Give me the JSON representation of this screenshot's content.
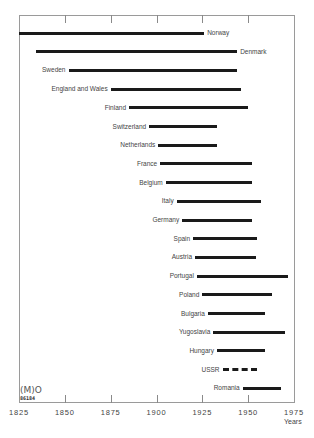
{
  "chart_data": {
    "type": "bar",
    "orientation": "horizontal-range",
    "title": "",
    "xlabel": "Years",
    "ylabel": "",
    "xlim": [
      1825,
      1975
    ],
    "x_ticks": [
      1825,
      1850,
      1875,
      1900,
      1925,
      1950,
      1975
    ],
    "grid": false,
    "legend": null,
    "series": [
      {
        "name": "Norway",
        "start": 1825,
        "end": 1926,
        "style": "solid",
        "label_side": "right"
      },
      {
        "name": "Denmark",
        "start": 1834,
        "end": 1944,
        "style": "solid",
        "label_side": "right"
      },
      {
        "name": "Sweden",
        "start": 1852,
        "end": 1944,
        "style": "solid",
        "label_side": "left"
      },
      {
        "name": "England and Wales",
        "start": 1875,
        "end": 1946,
        "style": "solid",
        "label_side": "left"
      },
      {
        "name": "Finland",
        "start": 1885,
        "end": 1950,
        "style": "solid",
        "label_side": "left"
      },
      {
        "name": "Switzerland",
        "start": 1896,
        "end": 1933,
        "style": "solid",
        "label_side": "left"
      },
      {
        "name": "Netherlands",
        "start": 1901,
        "end": 1933,
        "style": "solid",
        "label_side": "left"
      },
      {
        "name": "France",
        "start": 1902,
        "end": 1952,
        "style": "solid",
        "label_side": "left"
      },
      {
        "name": "Belgium",
        "start": 1905,
        "end": 1952,
        "style": "solid",
        "label_side": "left"
      },
      {
        "name": "Italy",
        "start": 1911,
        "end": 1957,
        "style": "solid",
        "label_side": "left"
      },
      {
        "name": "Germany",
        "start": 1914,
        "end": 1952,
        "style": "solid",
        "label_side": "left"
      },
      {
        "name": "Spain",
        "start": 1920,
        "end": 1955,
        "style": "solid",
        "label_side": "left"
      },
      {
        "name": "Austria",
        "start": 1921,
        "end": 1954,
        "style": "solid",
        "label_side": "left"
      },
      {
        "name": "Portugal",
        "start": 1922,
        "end": 1972,
        "style": "solid",
        "label_side": "left"
      },
      {
        "name": "Poland",
        "start": 1925,
        "end": 1963,
        "style": "solid",
        "label_side": "left"
      },
      {
        "name": "Bulgaria",
        "start": 1928,
        "end": 1959,
        "style": "solid",
        "label_side": "left"
      },
      {
        "name": "Yugoslavia",
        "start": 1931,
        "end": 1970,
        "style": "solid",
        "label_side": "left"
      },
      {
        "name": "Hungary",
        "start": 1933,
        "end": 1959,
        "style": "solid",
        "label_side": "left"
      },
      {
        "name": "USSR",
        "start": 1936,
        "end": 1955,
        "style": "dashed",
        "label_side": "left"
      },
      {
        "name": "Romania",
        "start": 1947,
        "end": 1968,
        "style": "solid",
        "label_side": "left"
      }
    ]
  },
  "logo": {
    "mark": "(M)O",
    "code": "86184"
  }
}
